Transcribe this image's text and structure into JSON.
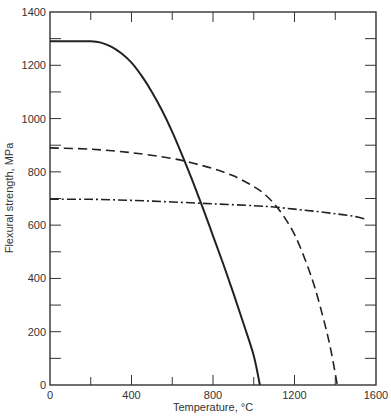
{
  "chart_data": {
    "type": "line",
    "title": "",
    "xlabel": "Temperature, °C",
    "ylabel": "Flexural strength, MPa",
    "xlim": [
      0,
      1600
    ],
    "ylim": [
      0,
      1400
    ],
    "x_ticks": [
      0,
      400,
      800,
      1200,
      1600
    ],
    "x_minor_ticks": [
      200,
      600,
      1000,
      1400
    ],
    "y_ticks": [
      0,
      200,
      400,
      600,
      800,
      1000,
      1200,
      1400
    ],
    "y_minor_ticks": [
      100,
      300,
      500,
      700,
      900,
      1100,
      1300
    ],
    "grid": false,
    "legend": null,
    "series": [
      {
        "name": "solid",
        "style": "solid",
        "x": [
          0,
          100,
          200,
          250,
          300,
          350,
          400,
          450,
          500,
          550,
          600,
          650,
          700,
          750,
          800,
          850,
          900,
          950,
          1000,
          1030
        ],
        "y": [
          1290,
          1290,
          1290,
          1285,
          1270,
          1245,
          1210,
          1160,
          1100,
          1030,
          950,
          860,
          765,
          665,
          560,
          455,
          345,
          230,
          110,
          0
        ]
      },
      {
        "name": "dashed",
        "style": "dashed",
        "x": [
          0,
          200,
          400,
          600,
          700,
          800,
          900,
          1000,
          1050,
          1100,
          1150,
          1200,
          1250,
          1300,
          1350,
          1380,
          1410
        ],
        "y": [
          890,
          885,
          872,
          850,
          833,
          812,
          785,
          745,
          718,
          680,
          630,
          565,
          475,
          365,
          225,
          125,
          0
        ]
      },
      {
        "name": "dash-dot",
        "style": "dash-dot",
        "x": [
          0,
          200,
          400,
          600,
          800,
          1000,
          1100,
          1200,
          1300,
          1400,
          1500,
          1550
        ],
        "y": [
          697,
          697,
          693,
          687,
          680,
          673,
          668,
          660,
          652,
          643,
          632,
          622
        ]
      }
    ]
  }
}
